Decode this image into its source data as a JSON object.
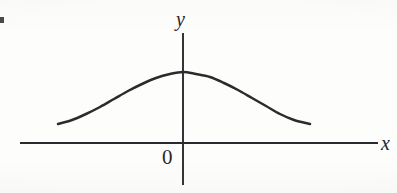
{
  "figure": {
    "background_color": "#fdfdfc",
    "ink_color": "#2b2b2f",
    "width": 397,
    "height": 193
  },
  "labels": {
    "y_axis": "y",
    "x_axis": "x",
    "origin": "0"
  },
  "chart_data": {
    "type": "line",
    "title": "",
    "subtitle": "",
    "xlabel": "x",
    "ylabel": "y",
    "legend": [],
    "legend_position": "none",
    "grid": false,
    "axes": {
      "x_axis_y_px": 143,
      "x_axis_start_px": 20,
      "x_axis_end_px": 378,
      "y_axis_x_px": 183,
      "y_axis_top_px": 33,
      "y_axis_bottom_px": 185,
      "origin_label": "0",
      "arrowheads": false,
      "tick_labels_x": [],
      "tick_labels_y": []
    },
    "series": [
      {
        "name": "bell curve",
        "description": "symmetric bell-shaped (Gaussian-like) curve peaking on the y-axis, drawn only over a finite interval and not touching the x-axis",
        "points_px": [
          [
            58,
            124
          ],
          [
            72,
            120
          ],
          [
            86,
            114
          ],
          [
            100,
            107
          ],
          [
            114,
            99
          ],
          [
            128,
            91
          ],
          [
            142,
            84
          ],
          [
            156,
            78
          ],
          [
            170,
            74
          ],
          [
            183,
            72
          ],
          [
            196,
            74
          ],
          [
            210,
            77
          ],
          [
            224,
            83
          ],
          [
            238,
            90
          ],
          [
            252,
            98
          ],
          [
            266,
            106
          ],
          [
            280,
            114
          ],
          [
            294,
            120
          ],
          [
            310,
            124
          ]
        ],
        "peak_px": [
          183,
          72
        ],
        "left_endpoint_px": [
          58,
          124
        ],
        "right_endpoint_px": [
          310,
          124
        ]
      }
    ],
    "annotations": []
  }
}
